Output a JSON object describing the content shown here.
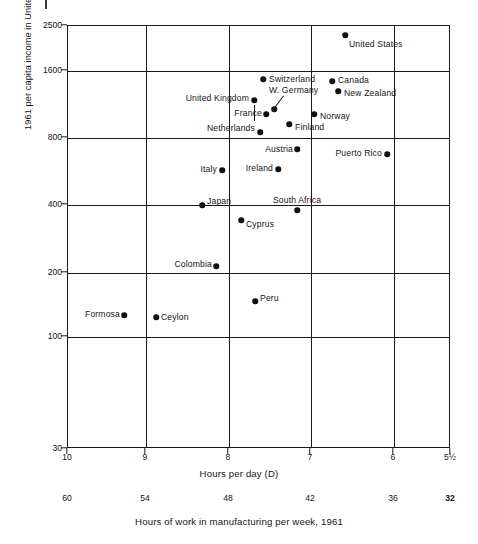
{
  "chart_data": {
    "type": "scatter",
    "title": "",
    "xlabel": "Hours per day (D)",
    "ylabel": "1961 per capita income in United States dollars",
    "secondary_xlabel": "Hours of work in manufacturing per week, 1961",
    "y_scale": "log",
    "ylim": [
      30,
      2500
    ],
    "xlim": [
      10,
      5.5
    ],
    "x_inverted": true,
    "grid": true,
    "legend": "none",
    "y_ticks": [
      {
        "label": "2500",
        "value": 2500,
        "px": 25
      },
      {
        "label": "1600",
        "value": 1600,
        "px": 70
      },
      {
        "label": "800",
        "value": 800,
        "px": 137
      },
      {
        "label": "400",
        "value": 400,
        "px": 204
      },
      {
        "label": "200",
        "value": 200,
        "px": 272
      },
      {
        "label": "100",
        "value": 100,
        "px": 336
      },
      {
        "label": "30",
        "value": 30,
        "px": 448
      }
    ],
    "x_ticks": [
      {
        "label": "10",
        "value": 10,
        "px": 67
      },
      {
        "label": "9",
        "value": 9,
        "px": 145
      },
      {
        "label": "8",
        "value": 8,
        "px": 228
      },
      {
        "label": "7",
        "value": 7,
        "px": 310
      },
      {
        "label": "6",
        "value": 6,
        "px": 393
      },
      {
        "label": "5½",
        "value": 5.5,
        "px": 450
      }
    ],
    "x_ticks_secondary": [
      {
        "label": "60",
        "value": 60,
        "px": 67,
        "bold": false
      },
      {
        "label": "54",
        "value": 54,
        "px": 145,
        "bold": false
      },
      {
        "label": "48",
        "value": 48,
        "px": 228,
        "bold": false
      },
      {
        "label": "42",
        "value": 42,
        "px": 310,
        "bold": false
      },
      {
        "label": "36",
        "value": 36,
        "px": 393,
        "bold": false
      },
      {
        "label": "32",
        "value": 32,
        "px": 450,
        "bold": true
      }
    ],
    "gridlines_v_px": [
      145,
      228,
      310,
      393
    ],
    "gridlines_h_px": [
      70,
      137,
      204,
      272,
      336
    ],
    "points": [
      {
        "name": "United States",
        "hours_per_day": 7.3,
        "income": 2240,
        "px": 344,
        "py": 34,
        "label_pos": "rgt",
        "lx": 348,
        "ly": 43
      },
      {
        "name": "Switzerland",
        "hours_per_day": 7.95,
        "income": 1490,
        "px": 262,
        "py": 78,
        "label_pos": "rgt",
        "lx": 268,
        "ly": 78
      },
      {
        "name": "Canada",
        "hours_per_day": 7.08,
        "income": 1460,
        "px": 331,
        "py": 80,
        "label_pos": "rgt",
        "lx": 337,
        "ly": 79
      },
      {
        "name": "New Zealand",
        "hours_per_day": 7.0,
        "income": 1330,
        "px": 337,
        "py": 90,
        "label_pos": "rgt",
        "lx": 343,
        "ly": 92
      },
      {
        "name": "United Kingdom",
        "hours_per_day": 8.05,
        "income": 1200,
        "px": 253,
        "py": 99,
        "label_pos": "lft",
        "lx": 248,
        "ly": 97
      },
      {
        "name": "W. Germany",
        "hours_per_day": 7.8,
        "income": 1100,
        "px": 273,
        "py": 108,
        "label_pos": "rgt",
        "lx": 268,
        "ly": 89
      },
      {
        "name": "France",
        "hours_per_day": 7.88,
        "income": 1040,
        "px": 265,
        "py": 113,
        "label_pos": "lft",
        "lx": 261,
        "ly": 112
      },
      {
        "name": "Norway",
        "hours_per_day": 7.18,
        "income": 1020,
        "px": 313,
        "py": 113,
        "label_pos": "rgt",
        "lx": 319,
        "ly": 115
      },
      {
        "name": "Finland",
        "hours_per_day": 7.55,
        "income": 900,
        "px": 288,
        "py": 123,
        "label_pos": "rgt",
        "lx": 294,
        "ly": 126
      },
      {
        "name": "Netherlands",
        "hours_per_day": 7.98,
        "income": 840,
        "px": 259,
        "py": 131,
        "label_pos": "lft",
        "lx": 254,
        "ly": 127
      },
      {
        "name": "Austria",
        "hours_per_day": 7.63,
        "income": 740,
        "px": 296,
        "py": 148,
        "label_pos": "lft",
        "lx": 292,
        "ly": 148
      },
      {
        "name": "Puerto Rico",
        "hours_per_day": 6.28,
        "income": 710,
        "px": 386,
        "py": 153,
        "label_pos": "lft",
        "lx": 381,
        "ly": 152
      },
      {
        "name": "Italy",
        "hours_per_day": 8.3,
        "income": 565,
        "px": 221,
        "py": 169,
        "label_pos": "lft",
        "lx": 216,
        "ly": 168
      },
      {
        "name": "Ireland",
        "hours_per_day": 7.75,
        "income": 575,
        "px": 277,
        "py": 168,
        "label_pos": "lft",
        "lx": 272,
        "ly": 167
      },
      {
        "name": "Japan",
        "hours_per_day": 8.5,
        "income": 400,
        "px": 201,
        "py": 204,
        "label_pos": "rgt",
        "lx": 206,
        "ly": 200
      },
      {
        "name": "South Africa",
        "hours_per_day": 7.62,
        "income": 390,
        "px": 296,
        "py": 209,
        "label_pos": "ctr",
        "lx": 296,
        "ly": 199
      },
      {
        "name": "Cyprus",
        "hours_per_day": 7.9,
        "income": 350,
        "px": 240,
        "py": 219,
        "label_pos": "rgt",
        "lx": 245,
        "ly": 223
      },
      {
        "name": "Colombia",
        "hours_per_day": 8.08,
        "income": 220,
        "px": 215,
        "py": 265,
        "label_pos": "lft",
        "lx": 211,
        "ly": 263
      },
      {
        "name": "Peru",
        "hours_per_day": 7.65,
        "income": 155,
        "px": 254,
        "py": 300,
        "label_pos": "rgt",
        "lx": 259,
        "ly": 297
      },
      {
        "name": "Formosa",
        "hours_per_day": 9.28,
        "income": 130,
        "px": 123,
        "py": 314,
        "label_pos": "lft",
        "lx": 119,
        "ly": 313
      },
      {
        "name": "Ceylon",
        "hours_per_day": 9.05,
        "income": 128,
        "px": 155,
        "py": 316,
        "label_pos": "rgt",
        "lx": 160,
        "ly": 316
      }
    ],
    "annotations": [
      {
        "type": "leader-line",
        "for": "W. Germany",
        "from_px": 283,
        "from_py": 95,
        "to_px": 274,
        "to_py": 107
      },
      {
        "type": "tick-stub",
        "near": "France",
        "px": 253,
        "py_top": 104,
        "py_bottom": 120
      }
    ]
  }
}
